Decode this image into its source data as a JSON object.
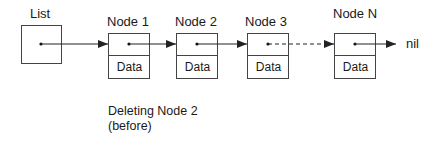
{
  "diagram": {
    "title": "Deleting Node 2",
    "caption_line1": "Deleting Node 2",
    "caption_line2": "(before)",
    "head": {
      "label": "List"
    },
    "nodes": [
      {
        "label": "Node 1",
        "field": "Data"
      },
      {
        "label": "Node 2",
        "field": "Data"
      },
      {
        "label": "Node 3",
        "field": "Data"
      },
      {
        "label": "Node N",
        "field": "Data"
      }
    ],
    "terminator": "nil",
    "edges": [
      {
        "from": "List",
        "to": "Node 1",
        "style": "solid"
      },
      {
        "from": "Node 1",
        "to": "Node 2",
        "style": "solid"
      },
      {
        "from": "Node 2",
        "to": "Node 3",
        "style": "solid"
      },
      {
        "from": "Node 3",
        "to": "Node N",
        "style": "dashed"
      },
      {
        "from": "Node N",
        "to": "nil",
        "style": "solid"
      }
    ],
    "colors": {
      "stroke": "#333333",
      "text": "#1a1a1a",
      "background": "#ffffff"
    }
  }
}
